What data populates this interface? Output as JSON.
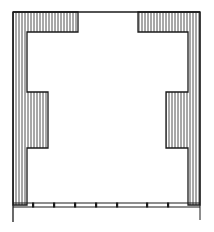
{
  "diagram": {
    "type": "architectural-floor-plan",
    "colors": {
      "line": "#1a1a1a",
      "background": "#ffffff"
    },
    "elements": [
      {
        "name": "top-wall-line"
      },
      {
        "name": "left-wall-hatched"
      },
      {
        "name": "right-wall-hatched"
      },
      {
        "name": "top-left-corner-block"
      },
      {
        "name": "top-right-corner-block"
      },
      {
        "name": "left-pilaster"
      },
      {
        "name": "right-pilaster"
      },
      {
        "name": "bottom-window-strip",
        "mullions": 7
      }
    ]
  }
}
